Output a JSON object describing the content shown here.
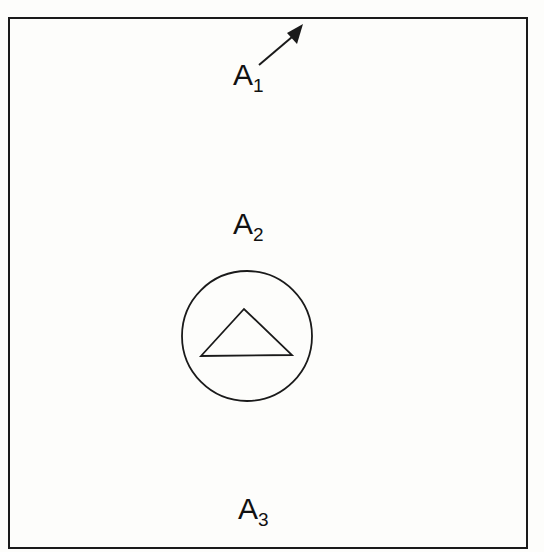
{
  "diagram": {
    "frame": {
      "x": 9,
      "y": 18,
      "width": 518,
      "height": 530,
      "stroke": "#1a1a1a"
    },
    "circle": {
      "cx": 247,
      "cy": 336,
      "r": 65
    },
    "triangle": {
      "points": "201,356 244,309 292,355"
    },
    "arrow": {
      "x1": 259,
      "y1": 65,
      "x2": 298,
      "y2": 32
    },
    "labels": [
      {
        "id": "a1",
        "main": "A",
        "sub": "1",
        "x": 233,
        "y": 62
      },
      {
        "id": "a2",
        "main": "A",
        "sub": "2",
        "x": 233,
        "y": 210
      },
      {
        "id": "a3",
        "main": "A",
        "sub": "3",
        "x": 238,
        "y": 496
      }
    ]
  }
}
